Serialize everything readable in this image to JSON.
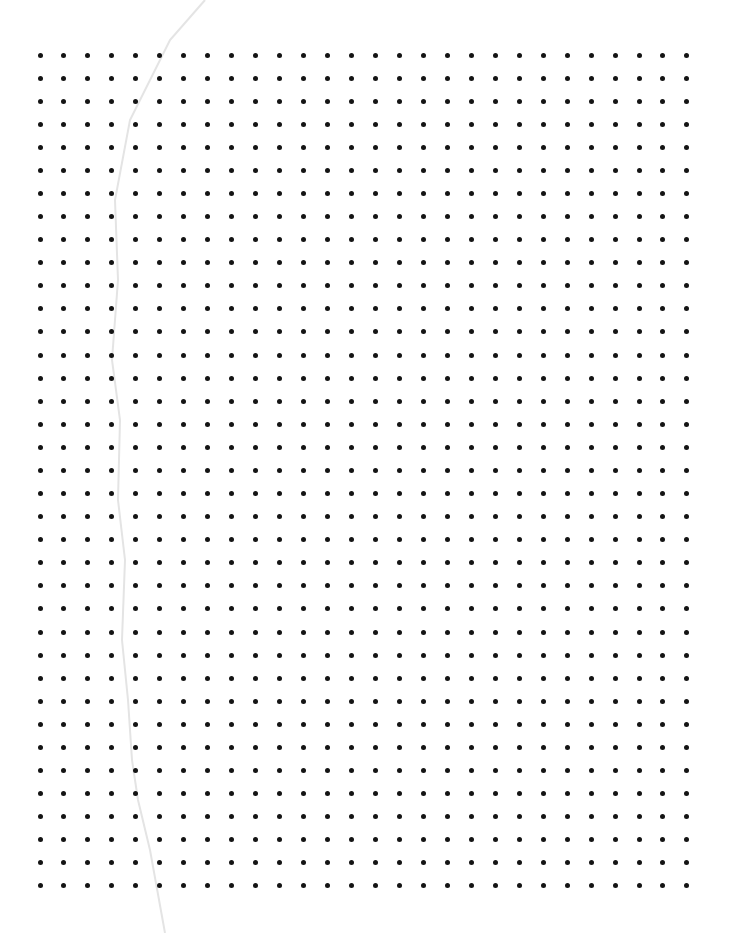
{
  "page": {
    "type": "dot-grid-paper",
    "background": "#ffffff",
    "dot_color": "#141414"
  },
  "grid": {
    "columns": 28,
    "rows": 37,
    "origin_x": 40,
    "origin_y": 55,
    "spacing_x": 23.96,
    "spacing_y": 23.08,
    "dot_diameter": 5
  },
  "crease": {
    "color": "#e4e4e4",
    "points": [
      [
        205,
        0
      ],
      [
        170,
        40
      ],
      [
        130,
        120
      ],
      [
        115,
        200
      ],
      [
        118,
        280
      ],
      [
        112,
        360
      ],
      [
        120,
        420
      ],
      [
        118,
        500
      ],
      [
        125,
        560
      ],
      [
        122,
        640
      ],
      [
        128,
        700
      ],
      [
        132,
        760
      ],
      [
        138,
        800
      ],
      [
        150,
        850
      ],
      [
        165,
        933
      ]
    ]
  }
}
